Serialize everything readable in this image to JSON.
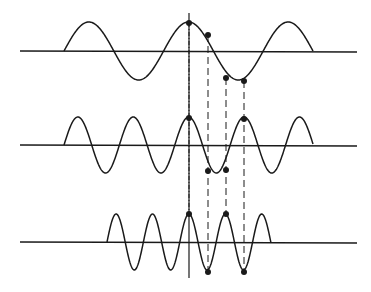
{
  "diagram": {
    "width": 371,
    "height": 292,
    "stroke_color": "#1a1a1a",
    "background": "#ffffff",
    "vertical_axis": {
      "x": 189,
      "y1": 13,
      "y2": 278
    },
    "waves": [
      {
        "name": "low-frequency",
        "axis_y": 51,
        "axis_x1": 20,
        "axis_x2": 357,
        "x_start": 64,
        "x_end": 313,
        "amplitude": 29,
        "half_period": 49.8
      },
      {
        "name": "mid-frequency",
        "axis_y": 145,
        "axis_x1": 20,
        "axis_x2": 357,
        "x_start": 64,
        "x_end": 313,
        "amplitude": 28,
        "half_period": 27.7
      },
      {
        "name": "high-frequency",
        "axis_y": 242,
        "axis_x1": 20,
        "axis_x2": 357,
        "x_start": 107,
        "x_end": 271,
        "amplitude": 28,
        "half_period": 18.2
      }
    ],
    "points": [
      {
        "x": 189,
        "y": 23
      },
      {
        "x": 208,
        "y": 35
      },
      {
        "x": 226,
        "y": 78
      },
      {
        "x": 244,
        "y": 81
      },
      {
        "x": 189,
        "y": 118
      },
      {
        "x": 208,
        "y": 171
      },
      {
        "x": 226,
        "y": 170
      },
      {
        "x": 244,
        "y": 119
      },
      {
        "x": 189,
        "y": 214
      },
      {
        "x": 226,
        "y": 214
      },
      {
        "x": 208,
        "y": 272
      },
      {
        "x": 244,
        "y": 272
      }
    ],
    "guide_lines": [
      {
        "x": 189,
        "y1": 23,
        "y2": 214,
        "style": "dash-dot"
      },
      {
        "x": 208,
        "y1": 35,
        "y2": 272,
        "style": "dashed"
      },
      {
        "x": 226,
        "y1": 78,
        "y2": 214,
        "style": "dashed"
      },
      {
        "x": 244,
        "y1": 81,
        "y2": 272,
        "style": "dashed"
      }
    ]
  }
}
